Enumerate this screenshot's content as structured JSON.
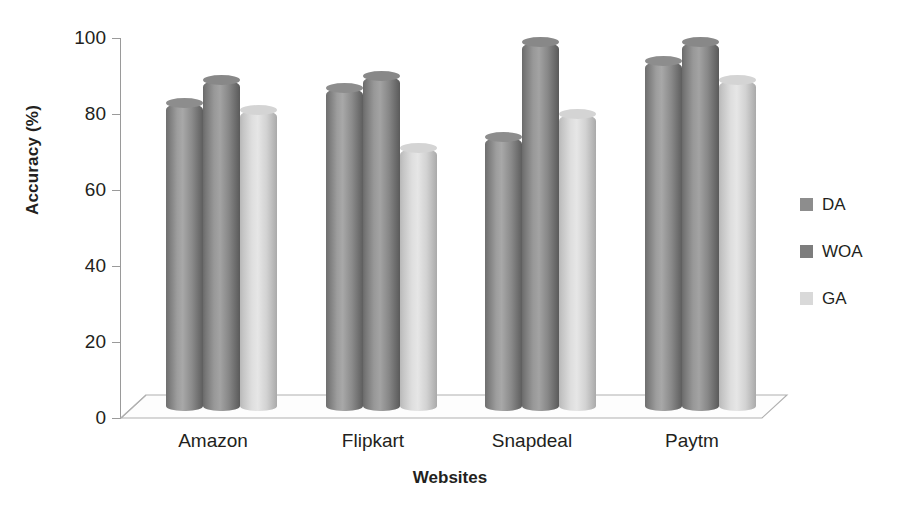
{
  "chart_data": {
    "type": "bar",
    "title": "",
    "xlabel": "Websites",
    "ylabel": "Accuracy (%)",
    "categories": [
      "Amazon",
      "Flipkart",
      "Snapdeal",
      "Paytm"
    ],
    "series": [
      {
        "name": "DA",
        "color": "#8d8d8d",
        "values": [
          81,
          85,
          72,
          92
        ]
      },
      {
        "name": "WOA",
        "color": "#7d7d7d",
        "values": [
          87,
          88,
          97,
          97
        ]
      },
      {
        "name": "GA",
        "color": "#d9d9d9",
        "values": [
          79,
          69,
          78,
          87
        ]
      }
    ],
    "ylim": [
      0,
      100
    ],
    "yticks": [
      0,
      20,
      40,
      60,
      80,
      100
    ],
    "ytick_labels": [
      "0",
      "20",
      "40",
      "60",
      "80",
      "100"
    ],
    "grid": false,
    "legend_position": "right",
    "style": "3d-cylinder"
  },
  "legend": {
    "entries": [
      {
        "label": "DA"
      },
      {
        "label": "WOA"
      },
      {
        "label": "GA"
      }
    ]
  }
}
